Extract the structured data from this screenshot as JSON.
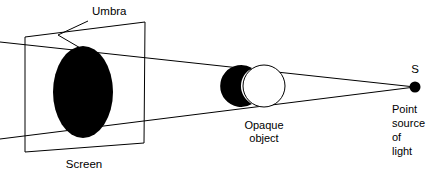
{
  "figure": {
    "type": "physics-ray-diagram",
    "topic": "Formation of umbra by a point source of light",
    "background_color": "#ffffff",
    "line_color": "#000000",
    "width": 443,
    "height": 174
  },
  "labels": {
    "umbra": "Umbra",
    "screen": "Screen",
    "opaque_line1": "Opaque",
    "opaque_line2": "object",
    "source_marker": "S",
    "source_line1": "Point",
    "source_line2": "source",
    "source_line3": "of",
    "source_line4": "light"
  },
  "elements": {
    "screen": {
      "name": "screen",
      "shape": "parallelogram",
      "fill": "#ffffff",
      "stroke": "#000000"
    },
    "umbra_shadow": {
      "name": "umbra",
      "shape": "ellipse",
      "fill": "#000000"
    },
    "opaque_object": {
      "name": "opaque-object",
      "shape": "sphere",
      "lit_side_fill": "#ffffff",
      "shadow_side_fill": "#000000"
    },
    "point_source": {
      "name": "point-source-of-light",
      "shape": "dot",
      "fill": "#000000"
    },
    "rays": {
      "name": "light-rays",
      "count": 2,
      "description": "tangent rays from point source past opaque object to screen"
    }
  }
}
